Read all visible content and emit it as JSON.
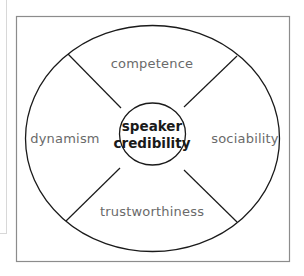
{
  "diagram": {
    "title": "",
    "center": {
      "line1": "speaker",
      "line2": "credibility"
    },
    "segments": [
      {
        "position": "top",
        "label": "competence"
      },
      {
        "position": "right",
        "label": "sociability"
      },
      {
        "position": "bottom",
        "label": "trustworthiness"
      },
      {
        "position": "left",
        "label": "dynamism"
      }
    ],
    "colors": {
      "stroke": "#1a1a1a",
      "frame": "#8c8c8c",
      "label": "#6a6a6a",
      "center_text": "#1a1a1a"
    }
  }
}
